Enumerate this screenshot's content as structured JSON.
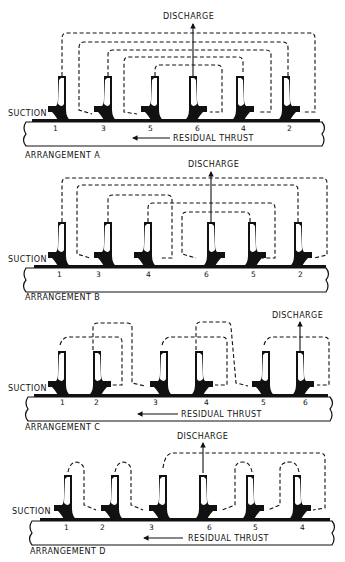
{
  "figure": {
    "arrangements": [
      {
        "id": "A",
        "label": "ARRANGEMENT A",
        "discharge_label": "DISCHARGE",
        "suction_label": "SUCTION",
        "thrust_label": "RESIDUAL THRUST",
        "stage_order": [
          "1",
          "3",
          "5",
          "6",
          "4",
          "2"
        ],
        "discharge_after_stage": "6"
      },
      {
        "id": "B",
        "label": "ARRANGEMENT B",
        "discharge_label": "DISCHARGE",
        "suction_label": "SUCTION",
        "thrust_label": "",
        "stage_order": [
          "1",
          "3",
          "4",
          "6",
          "5",
          "2"
        ],
        "discharge_after_stage": "6"
      },
      {
        "id": "C",
        "label": "ARRANGEMENT C",
        "discharge_label": "DISCHARGE",
        "suction_label": "SUCTION",
        "thrust_label": "RESIDUAL THRUST",
        "stage_order": [
          "1",
          "2",
          "3",
          "4",
          "5",
          "6"
        ],
        "discharge_after_stage": "6"
      },
      {
        "id": "D",
        "label": "ARRANGEMENT D",
        "discharge_label": "DISCHARGE",
        "suction_label": "SUCTION",
        "thrust_label": "RESIDUAL THRUST",
        "stage_order": [
          "1",
          "2",
          "3",
          "6",
          "5",
          "4"
        ],
        "discharge_after_stage": "6"
      }
    ]
  }
}
